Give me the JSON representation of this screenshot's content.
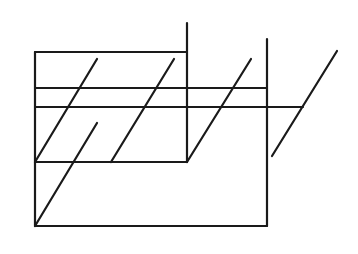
{
  "diagram": {
    "width": 358,
    "height": 254,
    "background": "#ffffff",
    "stroke_color": "#1a1a1a",
    "stroke_width": 2.2,
    "lines": [
      {
        "name": "rect-top-edge",
        "x1": 35,
        "y1": 52,
        "x2": 187,
        "y2": 52
      },
      {
        "name": "rect-left-edge",
        "x1": 35,
        "y1": 52,
        "x2": 35,
        "y2": 226
      },
      {
        "name": "rect-bottom-edge",
        "x1": 35,
        "y1": 226,
        "x2": 267,
        "y2": 226
      },
      {
        "name": "horizontal-upper",
        "x1": 35,
        "y1": 88,
        "x2": 267,
        "y2": 88
      },
      {
        "name": "horizontal-lower",
        "x1": 35,
        "y1": 107,
        "x2": 303,
        "y2": 107
      },
      {
        "name": "horizontal-middle",
        "x1": 35,
        "y1": 162,
        "x2": 187,
        "y2": 162
      },
      {
        "name": "vertical-center",
        "x1": 187,
        "y1": 23,
        "x2": 187,
        "y2": 162
      },
      {
        "name": "vertical-right",
        "x1": 267,
        "y1": 39,
        "x2": 267,
        "y2": 226
      },
      {
        "name": "diagonal-1",
        "x1": 97,
        "y1": 59,
        "x2": 35,
        "y2": 162
      },
      {
        "name": "diagonal-2",
        "x1": 174,
        "y1": 59,
        "x2": 111,
        "y2": 162
      },
      {
        "name": "diagonal-3",
        "x1": 251,
        "y1": 59,
        "x2": 187,
        "y2": 162
      },
      {
        "name": "diagonal-long",
        "x1": 97,
        "y1": 123,
        "x2": 35,
        "y2": 226
      },
      {
        "name": "diagonal-right",
        "x1": 337,
        "y1": 51,
        "x2": 272,
        "y2": 156
      }
    ]
  }
}
